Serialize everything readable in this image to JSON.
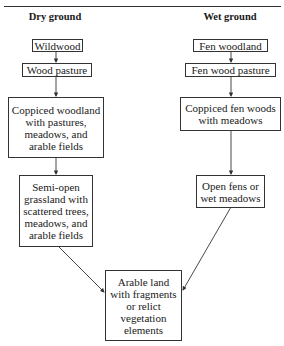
{
  "headers": {
    "dry": "Dry ground",
    "wet": "Wet ground"
  },
  "dry_column": [
    {
      "id": "wildwood",
      "lines": [
        "Wildwood"
      ]
    },
    {
      "id": "wood-pasture",
      "lines": [
        "Wood pasture"
      ]
    },
    {
      "id": "coppiced-woodland",
      "lines": [
        "Coppiced woodland",
        "with pastures,",
        "meadows, and",
        "arable fields"
      ]
    },
    {
      "id": "semi-open-grassland",
      "lines": [
        "Semi-open",
        "grassland with",
        "scattered trees,",
        "meadows, and",
        "arable fields"
      ]
    }
  ],
  "wet_column": [
    {
      "id": "fen-woodland",
      "lines": [
        "Fen woodland"
      ]
    },
    {
      "id": "fen-wood-pasture",
      "lines": [
        "Fen wood pasture"
      ]
    },
    {
      "id": "coppiced-fen-woods",
      "lines": [
        "Coppiced fen woods",
        "with meadows"
      ]
    },
    {
      "id": "open-fens",
      "lines": [
        "Open fens or",
        "wet meadows"
      ]
    }
  ],
  "final": {
    "id": "arable-land",
    "lines": [
      "Arable land",
      "with fragments",
      "or relict",
      "vegetation",
      "elements"
    ]
  }
}
